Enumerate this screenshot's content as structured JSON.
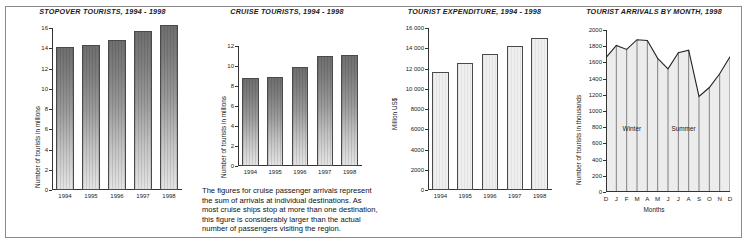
{
  "figure": {
    "frame_color": "#8a8a8a",
    "background": "#ffffff"
  },
  "note": {
    "text": "The figures for cruise passenger arrivals represent the sum of arrivals at individual destinations. As most cruise ships stop at more than one destination, this figure is considerably larger than the actual number of passengers visiting the region."
  },
  "chart_data": [
    {
      "type": "bar",
      "title": "STOPOVER TOURISTS, 1994 - 1998",
      "xlabel": "",
      "ylabel": "Number of tourists in millions",
      "categories": [
        "1994",
        "1995",
        "1996",
        "1997",
        "1998"
      ],
      "values": [
        14.1,
        14.3,
        14.8,
        15.7,
        16.3
      ],
      "ylim": [
        0,
        16
      ],
      "yticks": [
        0,
        2,
        4,
        6,
        8,
        10,
        12,
        14,
        16
      ],
      "ytick_labels": [
        "0",
        "2",
        "4",
        "6",
        "8",
        "10",
        "12",
        "14",
        "16"
      ],
      "grid": false,
      "legend": "none",
      "bar_style": "gradient-gray"
    },
    {
      "type": "bar",
      "title": "CRUISE TOURISTS, 1994 - 1998",
      "xlabel": "",
      "ylabel": "Number of tourists in millions",
      "categories": [
        "1994",
        "1995",
        "1996",
        "1997",
        "1998"
      ],
      "values": [
        8.8,
        8.9,
        9.9,
        11.0,
        11.1
      ],
      "ylim": [
        0,
        12
      ],
      "yticks": [
        0,
        2,
        4,
        6,
        8,
        10,
        12
      ],
      "ytick_labels": [
        "0",
        "2",
        "4",
        "6",
        "8",
        "10",
        "12"
      ],
      "grid": false,
      "legend": "none",
      "bar_style": "gradient-gray"
    },
    {
      "type": "bar",
      "title": "TOURIST EXPENDITURE, 1994 - 1998",
      "xlabel": "",
      "ylabel": "Million US$",
      "categories": [
        "1994",
        "1995",
        "1996",
        "1997",
        "1998"
      ],
      "values": [
        11700,
        12500,
        13400,
        14250,
        15050
      ],
      "ylim": [
        0,
        16000
      ],
      "yticks": [
        0,
        2000,
        4000,
        6000,
        8000,
        10000,
        12000,
        14000,
        16000
      ],
      "ytick_labels": [
        "0",
        "2000",
        "4000",
        "6000",
        "8000",
        "10 000",
        "12 000",
        "14 000",
        "16 000"
      ],
      "grid": false,
      "legend": "none",
      "bar_style": "light-outline"
    },
    {
      "type": "area",
      "title": "TOURIST ARRIVALS BY MONTH, 1998",
      "xlabel": "Months",
      "ylabel": "Number of tourists in thousands",
      "categories": [
        "D",
        "J",
        "F",
        "M",
        "A",
        "M",
        "J",
        "J",
        "A",
        "S",
        "O",
        "N",
        "D"
      ],
      "values": [
        1660,
        1810,
        1760,
        1880,
        1870,
        1650,
        1520,
        1720,
        1750,
        1180,
        1290,
        1460,
        1670
      ],
      "ylim": [
        0,
        2000
      ],
      "yticks": [
        0,
        200,
        400,
        600,
        800,
        1000,
        1200,
        1400,
        1600,
        1800,
        2000
      ],
      "ytick_labels": [
        "0",
        "200",
        "400",
        "600",
        "800",
        "1000",
        "1200",
        "1400",
        "1600",
        "1800",
        "2000"
      ],
      "grid": false,
      "legend": "none",
      "annotations": [
        {
          "label": "Winter",
          "x_index": 2.5,
          "y": 830
        },
        {
          "label": "Summer",
          "x_index": 7.5,
          "y": 830
        }
      ]
    }
  ]
}
